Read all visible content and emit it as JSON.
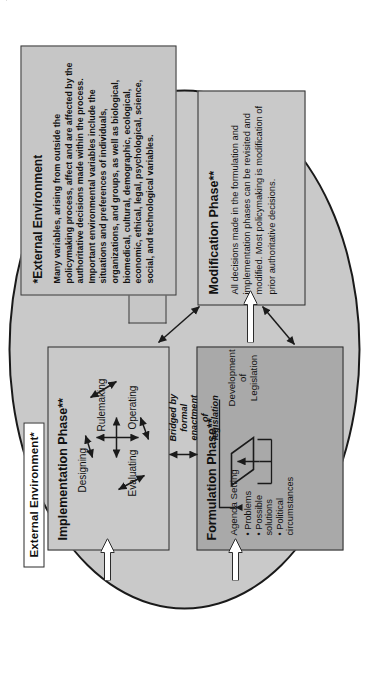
{
  "diagram": {
    "colors": {
      "ellipse_fill": "#c9c9c9",
      "formulation_fill": "#a9a9a9",
      "box_fill": "#c9c9c9",
      "callout_fill": "#c6c6c6",
      "outline": "#2b2b2b",
      "arrow_fill": "#ffffff"
    },
    "environment_label": "External Environment*"
  },
  "formulation": {
    "title": "Formulation Phase**",
    "agenda_setting": "Agenda Setting",
    "bullets": [
      "• Problems",
      "• Possible",
      "   solutions",
      "• Political",
      "   circumstances"
    ],
    "development": [
      "Development",
      "of",
      "Legislation"
    ],
    "window": "Window of Opportunity***"
  },
  "implementation": {
    "title": "Implementation Phase**",
    "nodes": [
      {
        "name": "Rulemaking",
        "position": "top"
      },
      {
        "name": "Designing",
        "position": "left"
      },
      {
        "name": "Operating",
        "position": "right"
      },
      {
        "name": "Evaluating",
        "position": "bottom"
      }
    ]
  },
  "modification": {
    "title": "Modification Phase**",
    "body": "All decisions made in the formulation and implementation phases can be revisited and modified. Most policymaking is modification of prior authoritative decisions."
  },
  "bridge": {
    "lines": [
      "Bridged by",
      "formal",
      "enactment",
      "of",
      "legislation"
    ],
    "text": "Bridged by formal enactment of legislation"
  },
  "external_environment": {
    "title": "*External Environment",
    "body": "Many variables, arising from outside the policymaking process, affect and are affected by the authoritative decisions made within the process. Important environmental variables include the situations and preferences of individuals, organizations, and groups, as well as biological, biomedical, cultural, demographic, ecological, economic, ethical, legal, psychological, science, social, and technological variables."
  },
  "arrows": {
    "to_formulation": "white-block-arrow",
    "to_implementation": "white-block-arrow",
    "to_modification": "white-block-arrow",
    "formulation_implementation": "double-headed-arrow",
    "implementation_modification": "double-headed-arrow",
    "formulation_modification": "double-headed-arrow"
  }
}
